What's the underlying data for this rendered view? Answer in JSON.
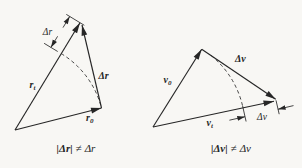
{
  "figure": {
    "page_background": "#f8f7f4",
    "ink_color": "#262626",
    "left_diagram": {
      "labels": {
        "final_vector": {
          "base": "r",
          "sub": "t"
        },
        "initial_vector": {
          "base": "r",
          "sub": "0"
        },
        "delta_vector": "Δr",
        "delta_scalar": "Δr"
      },
      "caption": {
        "lhs": "|Δr|",
        "relation": "≠",
        "rhs": "Δr"
      }
    },
    "right_diagram": {
      "labels": {
        "initial_vector": {
          "base": "v",
          "sub": "0"
        },
        "final_vector": {
          "base": "v",
          "sub": "t"
        },
        "delta_vector": "Δv",
        "delta_scalar": "Δv"
      },
      "caption": {
        "lhs": "|Δv|",
        "relation": "≠",
        "rhs": "Δv"
      }
    }
  }
}
